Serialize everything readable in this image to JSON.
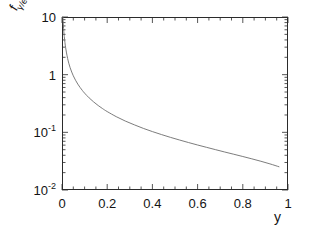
{
  "figure": {
    "background_color": "#ffffff",
    "frame_color": "#2b2b2b",
    "curve_color": "#6d6d6d"
  },
  "axis_titles": {
    "y_base": "f",
    "y_sub": "γ/e",
    "x": "y"
  },
  "y_ticks": [
    {
      "label_mantissa": "10",
      "label_exp": "",
      "value": 10
    },
    {
      "label_mantissa": "1",
      "label_exp": "",
      "value": 1
    },
    {
      "label_mantissa": "10",
      "label_exp": "-1",
      "value": 0.1
    },
    {
      "label_mantissa": "10",
      "label_exp": "-2",
      "value": 0.01
    }
  ],
  "x_ticks": [
    {
      "label": "0",
      "value": 0
    },
    {
      "label": "0.2",
      "value": 0.2
    },
    {
      "label": "0.4",
      "value": 0.4
    },
    {
      "label": "0.6",
      "value": 0.6
    },
    {
      "label": "0.8",
      "value": 0.8
    },
    {
      "label": "1",
      "value": 1
    }
  ],
  "chart_data": {
    "type": "line",
    "title": "",
    "xlabel": "y",
    "ylabel": "f_gamma/e",
    "xscale": "linear",
    "yscale": "log",
    "xlim": [
      0,
      1
    ],
    "ylim": [
      0.01,
      10
    ],
    "grid": false,
    "legend": null,
    "series": [
      {
        "name": "f_gamma/e",
        "x": [
          0.004,
          0.006,
          0.008,
          0.01,
          0.013,
          0.016,
          0.02,
          0.025,
          0.03,
          0.036,
          0.043,
          0.05,
          0.06,
          0.07,
          0.08,
          0.09,
          0.1,
          0.12,
          0.14,
          0.16,
          0.18,
          0.2,
          0.24,
          0.28,
          0.32,
          0.36,
          0.4,
          0.44,
          0.48,
          0.52,
          0.56,
          0.6,
          0.64,
          0.68,
          0.72,
          0.76,
          0.8,
          0.84,
          0.88,
          0.92,
          0.96
        ],
        "y": [
          10.0,
          7.2,
          5.6,
          4.6,
          3.6,
          2.95,
          2.38,
          1.9,
          1.58,
          1.32,
          1.11,
          0.955,
          0.8,
          0.685,
          0.6,
          0.533,
          0.478,
          0.396,
          0.337,
          0.292,
          0.257,
          0.229,
          0.187,
          0.157,
          0.135,
          0.117,
          0.103,
          0.0915,
          0.0818,
          0.0736,
          0.0665,
          0.0603,
          0.0549,
          0.05,
          0.0456,
          0.0417,
          0.0381,
          0.0347,
          0.0315,
          0.0284,
          0.0253
        ]
      }
    ]
  }
}
